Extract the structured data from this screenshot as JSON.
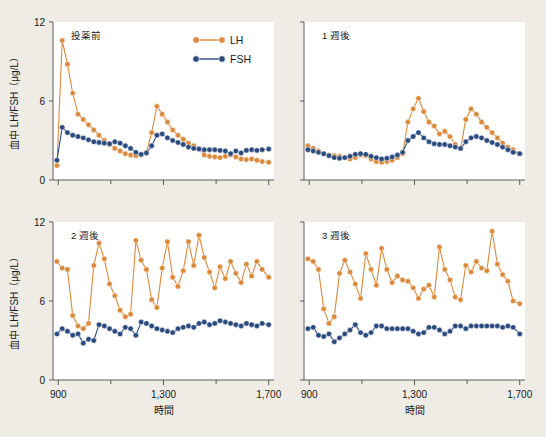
{
  "figure": {
    "background_color": "#efece6",
    "panel_background": "#ffffff",
    "axis_color": "#5a5a5a"
  },
  "legend": {
    "position": "top-center-right of first panel",
    "entries": [
      {
        "label": "LH",
        "color": "#d98a3d"
      },
      {
        "label": "FSH",
        "color": "#2b4a7d"
      }
    ]
  },
  "axes": {
    "ylabel": "血中 LH/FSH（μg/L）",
    "xlabel": "時間",
    "yticks": [
      "0",
      "6",
      "12"
    ],
    "ytick_values": [
      0,
      6,
      12
    ],
    "ylim": [
      0,
      12
    ],
    "xticks": [
      "900",
      "1,300",
      "1,700"
    ],
    "xtick_values": [
      900,
      1300,
      1700
    ],
    "xminor_values": [
      1100,
      1500
    ],
    "xlim": [
      880,
      1720
    ],
    "grid": false
  },
  "chart_data": [
    {
      "type": "line",
      "title": "投薬前",
      "panel": "top-left",
      "xlabel": "時間",
      "ylabel": "血中 LH/FSH（μg/L）",
      "ylim": [
        0,
        12
      ],
      "xlim": [
        880,
        1720
      ],
      "x": [
        895,
        915,
        935,
        955,
        975,
        995,
        1015,
        1035,
        1055,
        1075,
        1095,
        1115,
        1135,
        1155,
        1175,
        1195,
        1215,
        1235,
        1255,
        1275,
        1295,
        1315,
        1335,
        1355,
        1375,
        1395,
        1415,
        1435,
        1455,
        1475,
        1495,
        1515,
        1535,
        1555,
        1575,
        1595,
        1615,
        1635,
        1655,
        1675,
        1700
      ],
      "series": [
        {
          "name": "LH",
          "color": "#d98a3d",
          "values": [
            1.1,
            10.6,
            8.8,
            6.6,
            5.0,
            4.6,
            4.2,
            3.8,
            3.4,
            3.0,
            2.7,
            2.4,
            2.2,
            2.0,
            1.9,
            1.85,
            1.9,
            2.1,
            3.6,
            5.6,
            5.0,
            4.4,
            3.8,
            3.4,
            3.1,
            2.8,
            2.6,
            2.4,
            1.9,
            1.8,
            1.75,
            1.7,
            1.8,
            1.9,
            1.75,
            1.6,
            1.55,
            1.6,
            1.5,
            1.4,
            1.35
          ]
        },
        {
          "name": "FSH",
          "color": "#2b4a7d",
          "values": [
            1.5,
            4.0,
            3.6,
            3.4,
            3.3,
            3.2,
            3.05,
            2.9,
            2.85,
            2.8,
            2.75,
            2.9,
            2.8,
            2.6,
            2.4,
            2.1,
            1.95,
            2.05,
            2.6,
            3.4,
            3.5,
            3.2,
            3.0,
            2.85,
            2.7,
            2.5,
            2.4,
            2.35,
            2.3,
            2.3,
            2.3,
            2.25,
            2.2,
            2.0,
            2.2,
            2.05,
            2.25,
            2.3,
            2.25,
            2.3,
            2.35
          ]
        }
      ]
    },
    {
      "type": "line",
      "title": "1 週後",
      "panel": "top-right",
      "xlabel": "時間",
      "ylabel": "血中 LH/FSH（μg/L）",
      "ylim": [
        0,
        12
      ],
      "xlim": [
        880,
        1720
      ],
      "x": [
        895,
        915,
        935,
        955,
        975,
        995,
        1015,
        1035,
        1055,
        1075,
        1095,
        1115,
        1135,
        1155,
        1175,
        1195,
        1215,
        1235,
        1255,
        1275,
        1295,
        1315,
        1335,
        1355,
        1375,
        1395,
        1415,
        1435,
        1455,
        1475,
        1495,
        1515,
        1535,
        1555,
        1575,
        1595,
        1615,
        1635,
        1655,
        1675,
        1700
      ],
      "series": [
        {
          "name": "LH",
          "color": "#d98a3d",
          "values": [
            2.6,
            2.4,
            2.2,
            2.0,
            1.9,
            1.85,
            1.8,
            1.7,
            1.6,
            1.7,
            1.9,
            1.85,
            1.6,
            1.4,
            1.35,
            1.4,
            1.5,
            1.7,
            2.0,
            4.4,
            5.4,
            6.2,
            5.2,
            4.4,
            4.1,
            3.5,
            3.7,
            3.3,
            2.7,
            2.4,
            4.6,
            5.4,
            5.0,
            4.4,
            4.0,
            3.6,
            3.2,
            2.8,
            2.5,
            2.3,
            2.0
          ]
        },
        {
          "name": "FSH",
          "color": "#2b4a7d",
          "values": [
            2.3,
            2.2,
            2.1,
            2.0,
            1.85,
            1.7,
            1.65,
            1.7,
            1.8,
            1.95,
            2.0,
            1.95,
            1.8,
            1.7,
            1.6,
            1.65,
            1.75,
            1.9,
            2.1,
            3.0,
            3.3,
            3.6,
            3.2,
            2.9,
            2.75,
            2.7,
            2.7,
            2.6,
            2.5,
            2.4,
            2.9,
            3.2,
            3.3,
            3.2,
            3.0,
            2.85,
            2.7,
            2.5,
            2.3,
            2.1,
            2.0
          ]
        }
      ]
    },
    {
      "type": "line",
      "title": "2 週後",
      "panel": "bottom-left",
      "xlabel": "時間",
      "ylabel": "血中 LH/FSH（μg/L）",
      "ylim": [
        0,
        12
      ],
      "xlim": [
        880,
        1720
      ],
      "x": [
        895,
        915,
        935,
        955,
        975,
        995,
        1015,
        1035,
        1055,
        1075,
        1095,
        1115,
        1135,
        1155,
        1175,
        1195,
        1215,
        1235,
        1255,
        1275,
        1295,
        1315,
        1335,
        1355,
        1375,
        1395,
        1415,
        1435,
        1455,
        1475,
        1495,
        1515,
        1535,
        1555,
        1575,
        1595,
        1615,
        1635,
        1655,
        1675,
        1700
      ],
      "series": [
        {
          "name": "LH",
          "color": "#d98a3d",
          "values": [
            9.0,
            8.5,
            8.4,
            4.9,
            4.1,
            3.9,
            4.3,
            8.7,
            10.4,
            9.2,
            7.3,
            6.4,
            5.3,
            4.8,
            5.0,
            10.6,
            9.1,
            8.4,
            6.1,
            5.5,
            8.5,
            10.5,
            7.8,
            7.1,
            8.3,
            10.5,
            8.7,
            11.0,
            9.3,
            8.2,
            7.0,
            8.6,
            7.7,
            9.0,
            8.1,
            7.4,
            8.8,
            7.9,
            9.0,
            8.4,
            7.8
          ]
        },
        {
          "name": "FSH",
          "color": "#2b4a7d",
          "values": [
            3.5,
            3.9,
            3.7,
            3.4,
            3.5,
            2.8,
            3.1,
            3.0,
            4.2,
            4.1,
            3.9,
            3.7,
            3.5,
            4.0,
            3.9,
            3.4,
            4.4,
            4.3,
            4.1,
            3.9,
            3.8,
            3.7,
            3.6,
            3.9,
            4.0,
            4.1,
            4.0,
            4.3,
            4.4,
            4.2,
            4.3,
            4.5,
            4.4,
            4.3,
            4.2,
            4.1,
            4.3,
            4.2,
            4.1,
            4.3,
            4.2
          ]
        }
      ]
    },
    {
      "type": "line",
      "title": "3 週後",
      "panel": "bottom-right",
      "xlabel": "時間",
      "ylabel": "血中 LH/FSH（μg/L）",
      "ylim": [
        0,
        12
      ],
      "xlim": [
        880,
        1720
      ],
      "x": [
        895,
        915,
        935,
        955,
        975,
        995,
        1015,
        1035,
        1055,
        1075,
        1095,
        1115,
        1135,
        1155,
        1175,
        1195,
        1215,
        1235,
        1255,
        1275,
        1295,
        1315,
        1335,
        1355,
        1375,
        1395,
        1415,
        1435,
        1455,
        1475,
        1495,
        1515,
        1535,
        1555,
        1575,
        1595,
        1615,
        1635,
        1655,
        1675,
        1700
      ],
      "series": [
        {
          "name": "LH",
          "color": "#d98a3d",
          "values": [
            9.2,
            9.0,
            8.4,
            5.4,
            4.3,
            4.8,
            8.1,
            9.1,
            8.2,
            7.3,
            6.2,
            9.6,
            8.4,
            7.2,
            10.0,
            8.4,
            7.4,
            7.9,
            7.6,
            7.5,
            7.0,
            6.2,
            6.9,
            7.2,
            6.3,
            10.1,
            8.4,
            7.6,
            6.3,
            6.1,
            8.7,
            8.2,
            9.0,
            8.5,
            8.3,
            11.3,
            8.8,
            8.0,
            7.5,
            6.0,
            5.8
          ]
        },
        {
          "name": "FSH",
          "color": "#2b4a7d",
          "values": [
            3.9,
            4.0,
            3.4,
            3.3,
            3.5,
            2.9,
            3.2,
            3.5,
            3.8,
            4.2,
            3.6,
            3.4,
            3.6,
            4.1,
            4.1,
            3.9,
            3.9,
            3.9,
            3.9,
            3.9,
            3.7,
            3.5,
            3.6,
            4.0,
            4.0,
            3.8,
            3.5,
            3.7,
            4.1,
            4.1,
            3.9,
            4.1,
            4.1,
            4.1,
            4.1,
            4.1,
            4.1,
            4.0,
            4.1,
            4.0,
            3.5
          ]
        }
      ]
    }
  ]
}
